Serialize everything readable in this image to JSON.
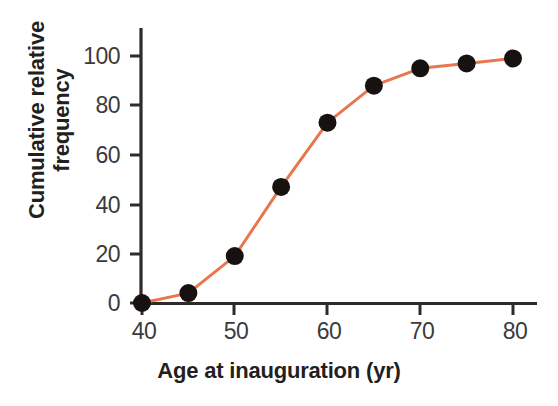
{
  "chart_data": {
    "type": "line",
    "title": "",
    "subtitle": "",
    "xlabel": "Age at inauguration (yr)",
    "ylabel": "Cumulative relative frequency",
    "ylabel_line1": "Cumulative relative",
    "ylabel_line2": "frequency",
    "x": [
      40,
      45,
      50,
      55,
      60,
      65,
      70,
      75,
      80
    ],
    "values": [
      0,
      4,
      19,
      47,
      73,
      88,
      95,
      97,
      99
    ],
    "series": [
      {
        "name": "Cumulative relative frequency",
        "x": [
          40,
          45,
          50,
          55,
          60,
          65,
          70,
          75,
          80
        ],
        "values": [
          0,
          4,
          19,
          47,
          73,
          88,
          95,
          97,
          99
        ]
      }
    ],
    "xlim": [
      40,
      80
    ],
    "ylim": [
      0,
      100
    ],
    "xticks": [
      40,
      50,
      60,
      70,
      80
    ],
    "yticks": [
      0,
      20,
      40,
      60,
      80,
      100
    ],
    "xtick_labels": [
      "40",
      "50",
      "60",
      "70",
      "80"
    ],
    "ytick_labels": [
      "0",
      "20",
      "40",
      "60",
      "80",
      "100"
    ],
    "grid": false,
    "legend": false,
    "legend_position": "none",
    "annotations": [],
    "colors": {
      "line": "#E8764E",
      "marker": "#17120f",
      "axis": "#2e2b29",
      "tick_text": "#3b3b3b",
      "axis_title": "#231f20",
      "background": "#ffffff"
    },
    "marker": "circle",
    "marker_size": 9,
    "line_width": 3
  }
}
